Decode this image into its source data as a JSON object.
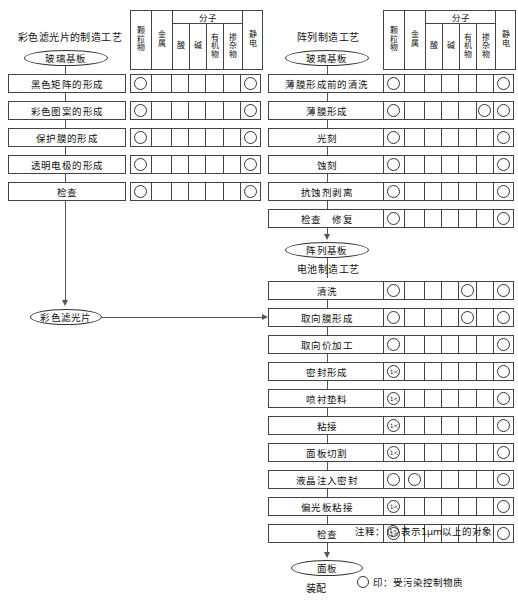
{
  "diagram": {
    "title_cf": "彩色滤光片的制造工艺",
    "title_array": "阵列制造工艺",
    "title_cell": "电池制造工艺",
    "assembly_label": "装配"
  },
  "table_header": {
    "col_particle": "颗粒物",
    "col_metal": "金属",
    "group_molecule": "分子",
    "col_acid": "酸",
    "col_alkali": "碱",
    "col_organic": "有机物",
    "col_dopant": "掺杂物",
    "col_static": "静电"
  },
  "marks": {
    "circle": "",
    "micron": "1<"
  },
  "cf_process": {
    "start_node": "玻璃基板",
    "end_node": "彩色滤光片",
    "steps": [
      {
        "label": "黑色矩阵的形成",
        "marks": [
          "o",
          "",
          "",
          "",
          "",
          "",
          "o"
        ]
      },
      {
        "label": "彩色图案的形成",
        "marks": [
          "o",
          "",
          "",
          "",
          "",
          "",
          "o"
        ]
      },
      {
        "label": "保护膜的形成",
        "marks": [
          "o",
          "",
          "",
          "",
          "",
          "",
          "o"
        ]
      },
      {
        "label": "透明电极的形成",
        "marks": [
          "o",
          "",
          "",
          "",
          "",
          "",
          "o"
        ]
      },
      {
        "label": "检查",
        "marks": [
          "o",
          "",
          "",
          "",
          "",
          "",
          "o"
        ]
      }
    ]
  },
  "array_process": {
    "start_node": "玻璃基板",
    "end_node": "阵列基板",
    "steps": [
      {
        "label": "薄膜形成前的清洗",
        "marks": [
          "o",
          "",
          "",
          "",
          "",
          "",
          "o"
        ]
      },
      {
        "label": "薄膜形成",
        "marks": [
          "o",
          "",
          "",
          "",
          "",
          "o",
          "o"
        ]
      },
      {
        "label": "光刻",
        "marks": [
          "o",
          "",
          "",
          "",
          "",
          "",
          "o"
        ]
      },
      {
        "label": "蚀刻",
        "marks": [
          "o",
          "",
          "",
          "",
          "",
          "",
          "o"
        ]
      },
      {
        "label": "抗蚀剂剥离",
        "marks": [
          "o",
          "",
          "",
          "",
          "",
          "",
          "o"
        ]
      },
      {
        "label": "检查　修复",
        "marks": [
          "o",
          "",
          "",
          "",
          "",
          "",
          "o"
        ]
      }
    ]
  },
  "cell_process": {
    "end_node": "面板",
    "steps": [
      {
        "label": "清洗",
        "marks": [
          "o",
          "",
          "",
          "",
          "o",
          "",
          "o"
        ]
      },
      {
        "label": "取向膜形成",
        "marks": [
          "o",
          "",
          "",
          "",
          "o",
          "",
          "o"
        ]
      },
      {
        "label": "取向价加工",
        "marks": [
          "o",
          "",
          "",
          "",
          "",
          "",
          "o"
        ]
      },
      {
        "label": "密封形成",
        "marks": [
          "m",
          "",
          "",
          "",
          "",
          "",
          "o"
        ]
      },
      {
        "label": "喷衬垫料",
        "marks": [
          "m",
          "",
          "",
          "",
          "",
          "",
          "o"
        ]
      },
      {
        "label": "粘接",
        "marks": [
          "m",
          "",
          "",
          "",
          "",
          "",
          "o"
        ]
      },
      {
        "label": "面板切割",
        "marks": [
          "m",
          "",
          "",
          "",
          "",
          "",
          "o"
        ]
      },
      {
        "label": "液晶注入密封",
        "marks": [
          "o",
          "o",
          "",
          "",
          "",
          "",
          "o"
        ]
      },
      {
        "label": "偏光板粘接",
        "marks": [
          "m",
          "",
          "",
          "",
          "",
          "",
          "o"
        ]
      },
      {
        "label": "检查",
        "marks": [
          "m",
          "",
          "",
          "",
          "",
          "",
          "o"
        ]
      }
    ]
  },
  "notes": {
    "micron_note_prefix": "注释：",
    "micron_note_suffix": "表示1μm以上的对象",
    "legend_text": "印：受污染控制物质"
  }
}
